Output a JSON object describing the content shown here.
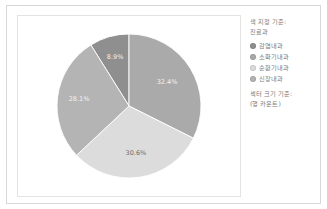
{
  "chart_data": {
    "type": "pie",
    "title": "",
    "subtitle": "",
    "xlabel": "",
    "ylabel": "",
    "grid": false,
    "legend_position": "right",
    "categories": [
      "감염내과",
      "소화기내과",
      "순환기내과",
      "신장내과"
    ],
    "values": [
      8.9,
      32.4,
      30.6,
      28.1
    ],
    "value_unit": "%",
    "slices": [
      {
        "label": "감염내과",
        "value": 8.9,
        "display": "8.9%",
        "color": "#8f8f8f",
        "start_angle": -32.0,
        "end_angle": 0.0,
        "label_angle": -16.0,
        "label_radius": 0.7,
        "label_color": "light"
      },
      {
        "label": "소화기내과",
        "value": 32.4,
        "display": "32.4%",
        "color": "#aaaaaa",
        "start_angle": 0.0,
        "end_angle": 116.6,
        "label_angle": 58.3,
        "label_radius": 0.62,
        "label_color": "light"
      },
      {
        "label": "순환기내과",
        "value": 30.6,
        "display": "30.6%",
        "color": "#dcdcdc",
        "start_angle": 116.6,
        "end_angle": 226.8,
        "label_angle": 171.7,
        "label_radius": 0.66,
        "label_color": "dark"
      },
      {
        "label": "신장내과",
        "value": 28.1,
        "display": "28.1%",
        "color": "#b4b4b4",
        "start_angle": 226.8,
        "end_angle": 328.0,
        "label_angle": 277.4,
        "label_radius": 0.7,
        "label_color": "light"
      }
    ]
  },
  "legend": {
    "title_line1": "색 지정 기준:",
    "title_line2": "진료과",
    "items": [
      {
        "label": "감염내과",
        "color": "#8f8f8f"
      },
      {
        "label": "소화기내과",
        "color": "#aaaaaa"
      },
      {
        "label": "순환기내과",
        "color": "#dcdcdc"
      },
      {
        "label": "신장내과",
        "color": "#b4b4b4"
      }
    ],
    "footer_line1": "섹터 크기 기준:",
    "footer_line2": "(행 카운트)"
  }
}
